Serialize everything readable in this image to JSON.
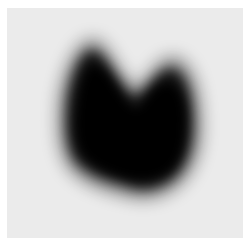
{
  "image": {
    "description": "Thyroid scintigraphy scan showing bilobed gland uptake",
    "alt": "Grayscale nuclear medicine thyroid scan",
    "background_color": "#ebebeb",
    "uptake_color": "#000000"
  }
}
